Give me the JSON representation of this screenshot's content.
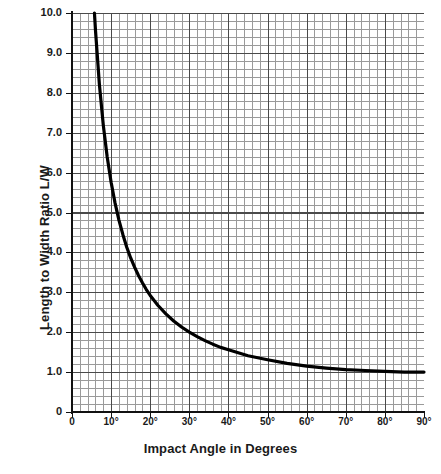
{
  "chart_data": {
    "type": "line",
    "title": "",
    "xlabel": "Impact Angle in Degrees",
    "ylabel": "Length to Width Ratio  L/W",
    "xlim": [
      0,
      90
    ],
    "ylim": [
      0,
      10
    ],
    "grid": true,
    "grid_style": "engineering graph paper, minor cells with bold line every 5th",
    "legend": "none",
    "series_name": "L/W = 1 / sin(impact angle)",
    "x": [
      5.74,
      6,
      7,
      8,
      9,
      10,
      11,
      12,
      13,
      14,
      15,
      16,
      17,
      18,
      19,
      20,
      22,
      24,
      26,
      28,
      30,
      32,
      34,
      36,
      38,
      40,
      45,
      50,
      55,
      60,
      65,
      70,
      75,
      80,
      85,
      90
    ],
    "y": [
      10.0,
      9.57,
      8.21,
      7.19,
      6.39,
      5.76,
      5.24,
      4.81,
      4.45,
      4.13,
      3.86,
      3.63,
      3.42,
      3.24,
      3.07,
      2.92,
      2.67,
      2.46,
      2.28,
      2.13,
      2.0,
      1.89,
      1.79,
      1.7,
      1.62,
      1.56,
      1.41,
      1.31,
      1.22,
      1.15,
      1.1,
      1.06,
      1.04,
      1.02,
      1.0,
      1.0
    ],
    "annotations": [],
    "xticks": [
      {
        "value": 0,
        "label": "0"
      },
      {
        "value": 10,
        "label": "10°"
      },
      {
        "value": 20,
        "label": "20°"
      },
      {
        "value": 30,
        "label": "30°"
      },
      {
        "value": 40,
        "label": "40°"
      },
      {
        "value": 50,
        "label": "50°"
      },
      {
        "value": 60,
        "label": "60°"
      },
      {
        "value": 70,
        "label": "70°"
      },
      {
        "value": 80,
        "label": "80°"
      },
      {
        "value": 90,
        "label": "90°"
      }
    ],
    "yticks": [
      {
        "value": 0,
        "label": "0"
      },
      {
        "value": 1.0,
        "label": "1.0"
      },
      {
        "value": 2.0,
        "label": "2.0"
      },
      {
        "value": 3.0,
        "label": "3.0"
      },
      {
        "value": 4.0,
        "label": "4.0"
      },
      {
        "value": 5.0,
        "label": "5.0"
      },
      {
        "value": 6.0,
        "label": "6.0"
      },
      {
        "value": 7.0,
        "label": "7.0"
      },
      {
        "value": 8.0,
        "label": "8.0"
      },
      {
        "value": 9.0,
        "label": "9.0"
      },
      {
        "value": 10.0,
        "label": "10.0"
      }
    ],
    "colors": {
      "curve": "#000000",
      "axis": "#111111",
      "grid_major": "#4a4a4a",
      "grid_minor": "#9a9a9a",
      "background": "#ffffff"
    }
  }
}
